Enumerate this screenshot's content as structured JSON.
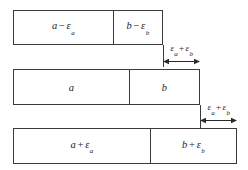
{
  "diagram": {
    "background_color": "#ffffff",
    "line_color": "#3a3a3a",
    "text_color": "#1c1c1c",
    "rows": [
      {
        "name": "lower-limit-row",
        "left_segment": {
          "var": "a",
          "op": "−",
          "eps": "ε",
          "sub": "a",
          "full": "a − εa"
        },
        "right_segment": {
          "var": "b",
          "op": "−",
          "eps": "ε",
          "sub": "b",
          "full": "b − εb"
        }
      },
      {
        "name": "nominal-row",
        "left_segment": {
          "var": "a",
          "op": "",
          "eps": "",
          "sub": "",
          "full": "a"
        },
        "right_segment": {
          "var": "b",
          "op": "",
          "eps": "",
          "sub": "",
          "full": "b"
        }
      },
      {
        "name": "upper-limit-row",
        "left_segment": {
          "var": "a",
          "op": "+",
          "eps": "ε",
          "sub": "a",
          "full": "a + εa"
        },
        "right_segment": {
          "var": "b",
          "op": "+",
          "eps": "ε",
          "sub": "b",
          "full": "b + εb"
        }
      }
    ],
    "dimensions": [
      {
        "name": "upper-dimension",
        "eps_a": "ε",
        "sub_a": "a",
        "plus": "+",
        "eps_b": "ε",
        "sub_b": "b",
        "full": "εa + εb"
      },
      {
        "name": "lower-dimension",
        "eps_a": "ε",
        "sub_a": "a",
        "plus": "+",
        "eps_b": "ε",
        "sub_b": "b",
        "full": "εa + εb"
      }
    ]
  }
}
